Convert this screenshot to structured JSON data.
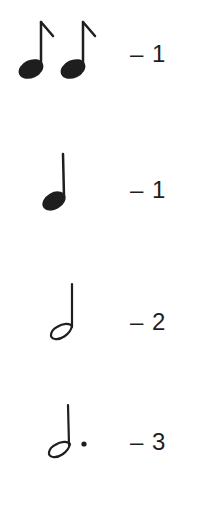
{
  "rows": [
    {
      "note": "two eighth notes",
      "icon": "eighth-notes-pair-icon",
      "beats_label": "– 1",
      "beats": 1
    },
    {
      "note": "quarter note",
      "icon": "quarter-note-icon",
      "beats_label": "– 1",
      "beats": 1
    },
    {
      "note": "half note",
      "icon": "half-note-icon",
      "beats_label": "– 2",
      "beats": 2
    },
    {
      "note": "dotted half note",
      "icon": "dotted-half-note-icon",
      "beats_label": "– 3",
      "beats": 3
    }
  ],
  "colors": {
    "ink": "#1e1e1e",
    "background": "#ffffff"
  }
}
